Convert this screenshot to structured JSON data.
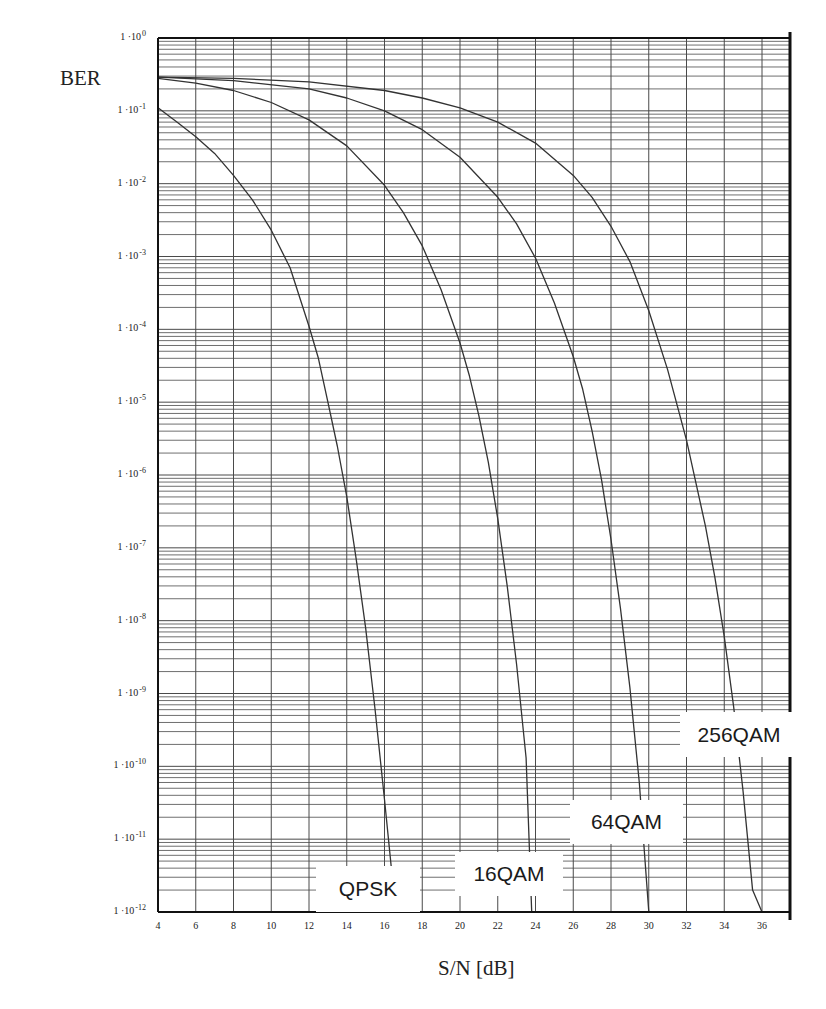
{
  "chart_data": {
    "type": "line",
    "title": "",
    "xlabel": "S/N [dB]",
    "ylabel": "BER",
    "xscale": "linear",
    "yscale": "log",
    "xlim": [
      4,
      37.3
    ],
    "ylim": [
      1e-12,
      1
    ],
    "grid": true,
    "legend_position": "inline labels near curve ends (bottom)",
    "x_ticks": [
      4,
      6,
      8,
      10,
      12,
      14,
      16,
      18,
      20,
      22,
      24,
      26,
      28,
      30,
      32,
      34,
      36
    ],
    "y_ticks": [
      {
        "value": 1.0,
        "label": "1 ·10",
        "exp": "0"
      },
      {
        "value": 0.1,
        "label": "1 ·10",
        "exp": "-1"
      },
      {
        "value": 0.01,
        "label": "1 ·10",
        "exp": "-2"
      },
      {
        "value": 0.001,
        "label": "1 ·10",
        "exp": "-3"
      },
      {
        "value": 0.0001,
        "label": "1 ·10",
        "exp": "-4"
      },
      {
        "value": 1e-05,
        "label": "1 ·10",
        "exp": "-5"
      },
      {
        "value": 1e-06,
        "label": "1 ·10",
        "exp": "-6"
      },
      {
        "value": 1e-07,
        "label": "1 ·10",
        "exp": "-7"
      },
      {
        "value": 1e-08,
        "label": "1 ·10",
        "exp": "-8"
      },
      {
        "value": 1e-09,
        "label": "1 ·10",
        "exp": "-9"
      },
      {
        "value": 1e-10,
        "label": "1 ·10",
        "exp": "-10"
      },
      {
        "value": 1e-11,
        "label": "1 ·10",
        "exp": "-11"
      },
      {
        "value": 1e-12,
        "label": "1 ·10",
        "exp": "-12"
      }
    ],
    "series": [
      {
        "name": "QPSK",
        "x": [
          4,
          5,
          6,
          7,
          8,
          9,
          10,
          11,
          12,
          12.5,
          13,
          13.5,
          14,
          14.5,
          15,
          15.5,
          16,
          16.5,
          16.8
        ],
        "y": [
          0.11,
          0.07,
          0.044,
          0.026,
          0.013,
          0.006,
          0.0023,
          0.0007,
          0.00011,
          4e-05,
          1e-05,
          2.5e-06,
          5e-07,
          7e-08,
          8e-09,
          6e-10,
          3.5e-11,
          1.8e-12,
          1e-12
        ]
      },
      {
        "name": "16QAM",
        "x": [
          4,
          6,
          8,
          10,
          12,
          14,
          16,
          17,
          18,
          19,
          20,
          20.5,
          21,
          21.5,
          22,
          22.5,
          23,
          23.5,
          23.8
        ],
        "y": [
          0.28,
          0.24,
          0.19,
          0.13,
          0.075,
          0.033,
          0.0095,
          0.004,
          0.0014,
          0.00035,
          6.5e-05,
          2.3e-05,
          6.5e-06,
          1.5e-06,
          2.5e-07,
          3e-08,
          2.5e-09,
          1.3e-10,
          1e-12
        ]
      },
      {
        "name": "64QAM",
        "x": [
          4,
          8,
          12,
          14,
          16,
          18,
          20,
          22,
          23,
          24,
          25,
          26,
          26.5,
          27,
          27.5,
          28,
          28.5,
          29,
          29.5,
          30
        ],
        "y": [
          0.29,
          0.26,
          0.2,
          0.15,
          0.1,
          0.055,
          0.023,
          0.0065,
          0.0028,
          0.00095,
          0.00023,
          4.2e-05,
          1.5e-05,
          4e-06,
          8.5e-07,
          1.3e-07,
          1.5e-08,
          1.2e-09,
          6e-11,
          1e-12
        ]
      },
      {
        "name": "256QAM",
        "x": [
          4,
          8,
          12,
          16,
          18,
          20,
          22,
          24,
          26,
          27,
          28,
          29,
          30,
          31,
          32,
          33,
          33.5,
          34,
          34.5,
          35,
          35.5,
          36
        ],
        "y": [
          0.29,
          0.28,
          0.25,
          0.19,
          0.15,
          0.11,
          0.07,
          0.036,
          0.013,
          0.0065,
          0.0026,
          0.00085,
          0.00018,
          2.8e-05,
          3e-06,
          2e-07,
          4e-08,
          6e-09,
          6.5e-10,
          4.5e-11,
          2e-12,
          1e-12
        ]
      }
    ],
    "annotations": [
      {
        "text": "QPSK",
        "box": [
          316,
          866,
          104,
          46
        ]
      },
      {
        "text": "16QAM",
        "box": [
          455,
          852,
          108,
          44
        ]
      },
      {
        "text": "64QAM",
        "box": [
          570,
          800,
          113,
          44
        ]
      },
      {
        "text": "256QAM",
        "box": [
          680,
          712,
          118,
          45
        ]
      }
    ]
  },
  "axes": {
    "ylabel": "BER",
    "xlabel": "S/N [dB]"
  },
  "style": {
    "grid_color": "#4a4a4a",
    "frame_color": "#111111",
    "curve_color": "#333333",
    "background": "#ffffff"
  }
}
